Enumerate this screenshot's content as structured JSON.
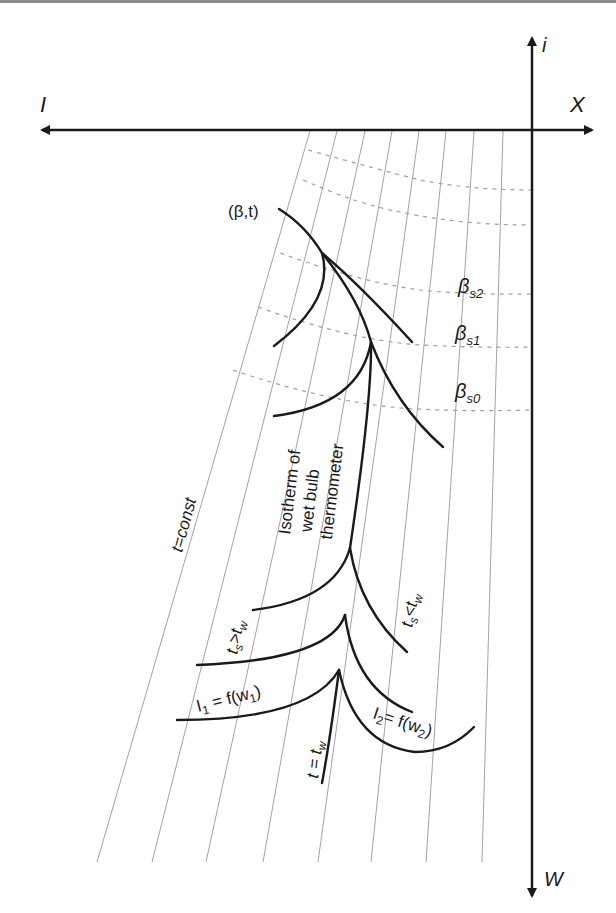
{
  "diagram": {
    "type": "psychrometric I-X (Mollier) diagram construction",
    "axes": {
      "horizontal_left_label": "I",
      "horizontal_right_label": "X",
      "vertical_top_label": "i",
      "vertical_bottom_label": "W"
    },
    "labels": {
      "point": "(β,t)",
      "beta_s2": "β",
      "beta_s2_sub": "s2",
      "beta_s1": "β",
      "beta_s1_sub": "s1",
      "beta_s0": "β",
      "beta_s0_sub": "s0",
      "t_const": "t=const",
      "isotherm_line1": "Isotherm of",
      "isotherm_line2": "wet bulb",
      "isotherm_line3": "thermometer",
      "ts_gt_tw": "t",
      "ts_gt_tw_sub": "s",
      "ts_gt_tw_rest": ">t",
      "ts_gt_tw_sub2": "w",
      "ts_lt_tw": "t",
      "ts_lt_tw_sub": "s",
      "ts_lt_tw_rest": "<t",
      "ts_lt_tw_sub2": "w",
      "I1_main": "I",
      "I1_sub": "1",
      "I1_rest": " = f(w",
      "I1_sub2": "1",
      "I1_close": ")",
      "I2_main": "I",
      "I2_sub": "2",
      "I2_rest": "= f(w",
      "I2_sub2": "2",
      "I2_close": ")",
      "t_eq_tw": "t = t",
      "t_eq_tw_sub": "w"
    },
    "colors": {
      "ink": "#1a1a1a",
      "grid": "#8c8c8c",
      "dashed": "#a0a0a0"
    }
  }
}
